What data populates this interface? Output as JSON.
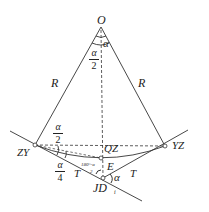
{
  "diagram": {
    "type": "circular curve geometry",
    "points": {
      "center": "O",
      "start_of_curve": "ZY",
      "end_of_curve": "YZ",
      "mid_of_curve": "QZ",
      "intersection": "JD",
      "intersection_subscript": "i",
      "external_point": "E"
    },
    "labels": {
      "radius_left": "R",
      "radius_right": "R",
      "tangent_left": "T",
      "tangent_right": "T",
      "angle_center": "α",
      "half_angle_num": "α",
      "half_angle_den": "2",
      "half_angle_zy_num": "α",
      "half_angle_zy_den": "2",
      "quarter_angle_num": "α",
      "quarter_angle_den": "4",
      "deflection_angle": "α",
      "angle_at_jd": "180°-α",
      "angle_at_jd_den": "2"
    },
    "colors": {
      "stroke": "#333333",
      "background": "#ffffff"
    }
  }
}
